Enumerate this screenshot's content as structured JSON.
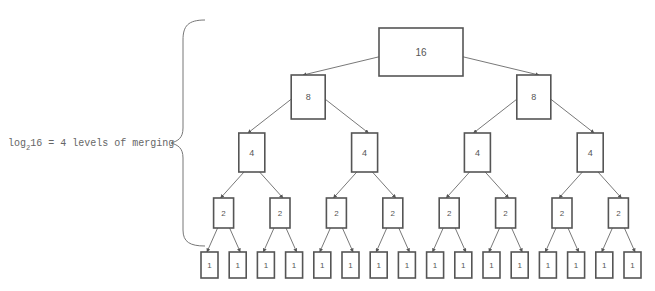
{
  "diagram": {
    "annotation": {
      "prefix": "log",
      "subscript": "2",
      "suffix": "16 = 4 levels of merging"
    },
    "levels": [
      {
        "values": [
          16
        ]
      },
      {
        "values": [
          8,
          8
        ]
      },
      {
        "values": [
          4,
          4,
          4,
          4
        ]
      },
      {
        "values": [
          2,
          2,
          2,
          2,
          2,
          2,
          2,
          2
        ]
      },
      {
        "values": [
          1,
          1,
          1,
          1,
          1,
          1,
          1,
          1,
          1,
          1,
          1,
          1,
          1,
          1,
          1,
          1
        ]
      }
    ],
    "colors": {
      "stroke": "#555555",
      "text": "#555555",
      "brace": "#777777"
    }
  }
}
